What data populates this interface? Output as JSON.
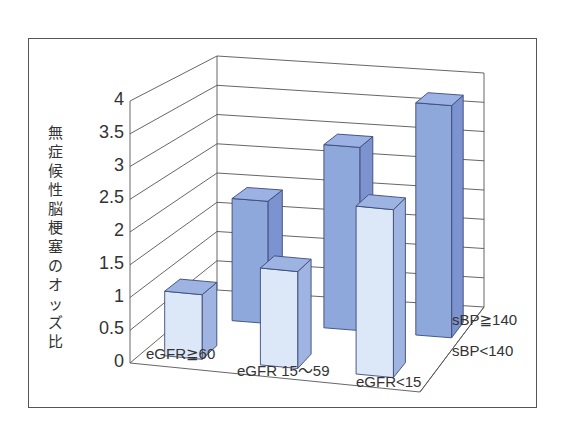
{
  "chart_data": {
    "type": "bar",
    "style": "3d-grouped",
    "title": "",
    "ylabel": "無症候性脳梗塞のオッズ比",
    "xlabel": "",
    "ylim": [
      0,
      4
    ],
    "yticks": [
      "0",
      "0.5",
      "1",
      "1.5",
      "2",
      "2.5",
      "3",
      "3.5",
      "4"
    ],
    "grid": true,
    "categories": [
      "eGFR≧60",
      "eGFR 15〜59",
      "eGFR<15"
    ],
    "series": [
      {
        "name": "sBP<140",
        "color": "#dce8f8",
        "values": [
          1.0,
          1.5,
          2.6
        ]
      },
      {
        "name": "sBP≧140",
        "color": "#8fa8dc",
        "values": [
          2.0,
          3.0,
          3.8
        ]
      }
    ],
    "legend_position": "right (depth axis labels)"
  },
  "colors": {
    "front_series_face": "#dce8f8",
    "front_series_side": "#9fb4e0",
    "front_series_top": "#9db3e2",
    "back_series_face": "#8fa8dc",
    "back_series_side": "#7c93cf",
    "back_series_top": "#9cb2e4",
    "edge": "#3b4a78",
    "gridline": "#555555"
  }
}
